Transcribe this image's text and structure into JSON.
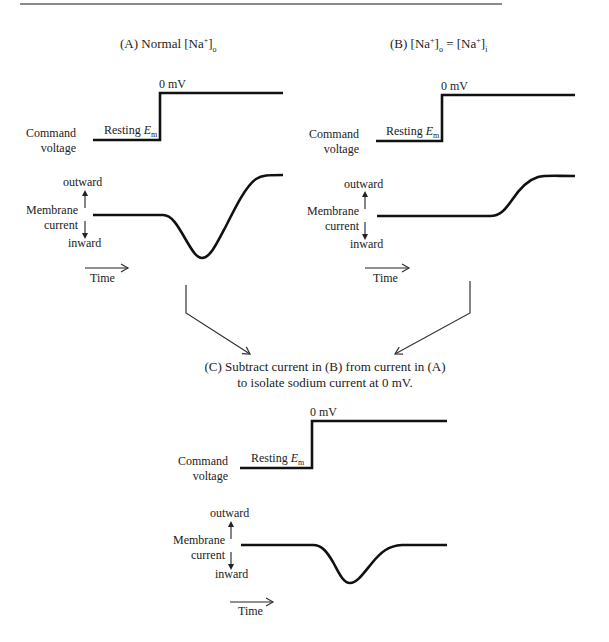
{
  "panels": {
    "a": {
      "title_prefix": "(A) Normal [Na",
      "title_sup": "+",
      "title_close": "]",
      "title_sub": "o",
      "voltage_high_label": "0 mV",
      "voltage_low_label": "Resting ",
      "em_label": "E",
      "em_sub": "m",
      "command_label_1": "Command",
      "command_label_2": "voltage",
      "outward_label": "outward",
      "membrane_label_1": "Membrane",
      "membrane_label_2": "current",
      "inward_label": "inward",
      "time_label": "Time"
    },
    "b": {
      "title_prefix": "(B) [Na",
      "title_sup": "+",
      "title_close": "]",
      "title_sub": "o",
      "title_eq": " = [Na",
      "title_sup2": "+",
      "title_close2": "]",
      "title_sub2": "i",
      "voltage_high_label": "0 mV",
      "voltage_low_label": "Resting ",
      "em_label": "E",
      "em_sub": "m",
      "command_label_1": "Command",
      "command_label_2": "voltage",
      "outward_label": "outward",
      "membrane_label_1": "Membrane",
      "membrane_label_2": "current",
      "inward_label": "inward",
      "time_label": "Time"
    },
    "c": {
      "caption_line_1": "(C) Subtract current in (B) from current in (A)",
      "caption_line_2": "to isolate sodium current at 0 mV.",
      "voltage_high_label": "0 mV",
      "voltage_low_label": "Resting ",
      "em_label": "E",
      "em_sub": "m",
      "command_label_1": "Command",
      "command_label_2": "voltage",
      "outward_label": "outward",
      "membrane_label_1": "Membrane",
      "membrane_label_2": "current",
      "inward_label": "inward",
      "time_label": "Time"
    }
  },
  "colors": {
    "trace": "#111111",
    "arrow": "#333333",
    "rule": "#8a8a8a"
  }
}
